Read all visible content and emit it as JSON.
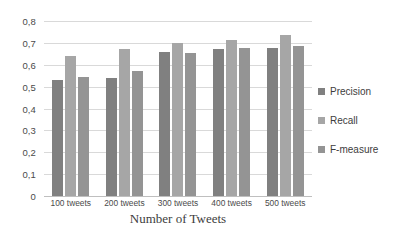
{
  "chart_data": {
    "type": "bar",
    "title": "",
    "subtitle": "",
    "xlabel": "Number of Tweets",
    "ylabel": "",
    "categories": [
      "100 tweets",
      "200 tweets",
      "300 tweets",
      "400 tweets",
      "500 tweets"
    ],
    "series": [
      {
        "name": "Precision",
        "values": [
          0.53,
          0.54,
          0.66,
          0.67,
          0.675
        ],
        "color": "#808080"
      },
      {
        "name": "Recall",
        "values": [
          0.64,
          0.67,
          0.7,
          0.715,
          0.735
        ],
        "color": "#a6a6a6"
      },
      {
        "name": "F-measure",
        "values": [
          0.545,
          0.57,
          0.655,
          0.675,
          0.685
        ],
        "color": "#949494"
      }
    ],
    "ylim": [
      0,
      0.8
    ],
    "ytick_labels": [
      "0,8",
      "0,7",
      "0,6",
      "0,5",
      "0,4",
      "0,3",
      "0,2",
      "0,1",
      "0"
    ],
    "ytick_values": [
      0.8,
      0.7,
      0.6,
      0.5,
      0.4,
      0.3,
      0.2,
      0.1,
      0
    ],
    "grid": true,
    "legend_position": "right"
  }
}
